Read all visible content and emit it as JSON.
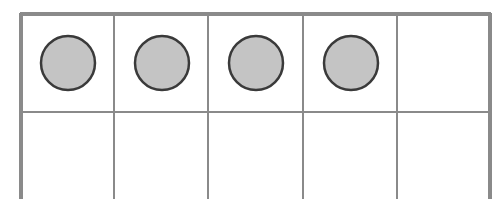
{
  "diagram": {
    "type": "ten-frame",
    "rows": 2,
    "columns": 5,
    "filled_count": 4,
    "total_cells": 10,
    "cells": [
      {
        "row": 0,
        "col": 0,
        "counter": true
      },
      {
        "row": 0,
        "col": 1,
        "counter": true
      },
      {
        "row": 0,
        "col": 2,
        "counter": true
      },
      {
        "row": 0,
        "col": 3,
        "counter": true
      },
      {
        "row": 0,
        "col": 4,
        "counter": false
      },
      {
        "row": 1,
        "col": 0,
        "counter": false
      },
      {
        "row": 1,
        "col": 1,
        "counter": false
      },
      {
        "row": 1,
        "col": 2,
        "counter": false
      },
      {
        "row": 1,
        "col": 3,
        "counter": false
      },
      {
        "row": 1,
        "col": 4,
        "counter": false
      }
    ],
    "colors": {
      "grid_line": "#8a8a8a",
      "counter_fill": "#c4c4c4",
      "counter_stroke": "#3a3a3a",
      "background": "#ffffff"
    }
  }
}
